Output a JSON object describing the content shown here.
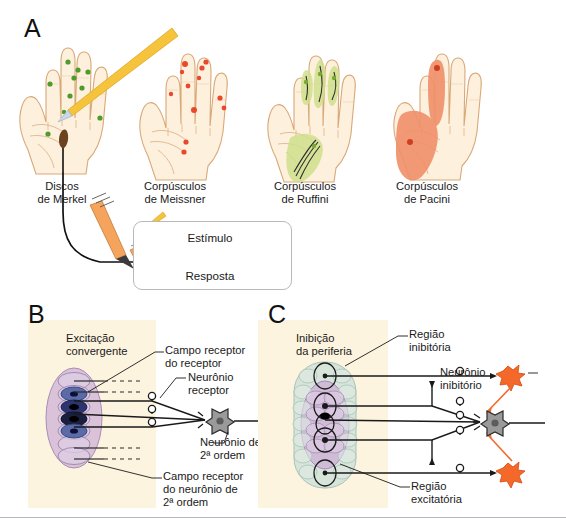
{
  "figure": {
    "panels": [
      {
        "id": "A",
        "letter": "A"
      },
      {
        "id": "B",
        "letter": "B"
      },
      {
        "id": "C",
        "letter": "C"
      }
    ]
  },
  "panelA": {
    "letter": "A",
    "receptors": [
      {
        "name": "merkel",
        "caption": "Discos\nde Merkel",
        "field_type": "small-points",
        "marker_color": "#5aa832",
        "hand_fill": "#fdf0dd",
        "hand_stroke": "#d9a878",
        "points": [
          {
            "x": 18,
            "y": 50
          },
          {
            "x": 40,
            "y": 38
          },
          {
            "x": 57,
            "y": 45
          },
          {
            "x": 62,
            "y": 30
          },
          {
            "x": 52,
            "y": 57
          },
          {
            "x": 64,
            "y": 60
          },
          {
            "x": 28,
            "y": 84
          },
          {
            "x": 83,
            "y": 72
          }
        ]
      },
      {
        "name": "meissner",
        "caption": "Corpúsculos\nde Meissner",
        "field_type": "small-points",
        "marker_color": "#e8492c",
        "hand_fill": "#fdf0dd",
        "hand_stroke": "#d9a878",
        "points": [
          {
            "x": 40,
            "y": 32
          },
          {
            "x": 36,
            "y": 45
          },
          {
            "x": 60,
            "y": 32
          },
          {
            "x": 64,
            "y": 28
          },
          {
            "x": 52,
            "y": 58
          },
          {
            "x": 30,
            "y": 78
          },
          {
            "x": 36,
            "y": 110
          },
          {
            "x": 33,
            "y": 120
          },
          {
            "x": 84,
            "y": 70
          },
          {
            "x": 80,
            "y": 62
          }
        ]
      },
      {
        "name": "ruffini",
        "caption": "Corpúsculos\nde Ruffini",
        "field_type": "elongated-zones",
        "marker_color": "#9bc44a",
        "zone_fill": "#d3e59a",
        "hand_fill": "#fdf0dd",
        "hand_stroke": "#d9a878"
      },
      {
        "name": "pacini",
        "caption": "Corpúsculos\nde Pacini",
        "field_type": "large-zones",
        "marker_color": "#e8492c",
        "zone_fill": "#f0906a",
        "hand_fill": "#fdf0dd",
        "hand_stroke": "#d9a878"
      }
    ],
    "probe": {
      "name": "yellow-probe",
      "color": "#f5c33c"
    },
    "trace_box": {
      "stimulus_label": "Estímulo",
      "response_label": "Resposta",
      "stimulus_trace_color": "#d96a50",
      "response_spikes": 11
    }
  },
  "panelB": {
    "letter": "B",
    "title": "Excitação\nconvergente",
    "field_color": "#c9aed0",
    "labels": [
      {
        "name": "campo-receptor-do-receptor",
        "text": "Campo receptor\ndo receptor"
      },
      {
        "name": "neuronio-receptor",
        "text": "Neurônio\nreceptor"
      },
      {
        "name": "neuronio-de-2a-ordem",
        "text": "Neurônio de\n2ª ordem"
      },
      {
        "name": "campo-receptor-neuronio-2a-ordem",
        "text": "Campo receptor\ndo neurônio de\n2ª ordem"
      }
    ],
    "secondary_neuron_color": "#8d8d8d",
    "active_receptor_count": 3,
    "total_receptor_count": 7
  },
  "panelC": {
    "letter": "C",
    "title": "Inibição\nda periferia",
    "field_color": "#c9aed0",
    "surround_color": "#cfe0d8",
    "inhibitory_color": "#f4682a",
    "labels": [
      {
        "name": "regiao-inibitoria",
        "text": "Região\ninibitória"
      },
      {
        "name": "neuronio-inibitorio",
        "text": "Neurônio\ninibitório"
      },
      {
        "name": "regiao-excitatoria",
        "text": "Região\nexcitatória"
      }
    ],
    "secondary_neuron_color": "#8d8d8d",
    "inhibitory_neuron_count": 2
  }
}
